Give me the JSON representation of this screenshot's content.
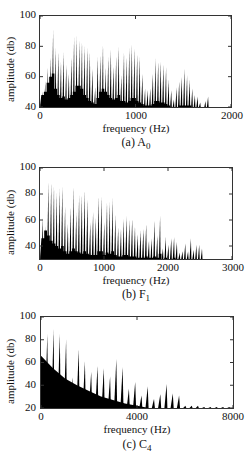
{
  "chart_data": [
    {
      "type": "bar",
      "title": "",
      "caption": "(a) A0",
      "caption_main": "(a) A",
      "caption_sub": "0",
      "xlabel": "frequency (Hz)",
      "ylabel": "amplitude (db)",
      "xlim": [
        0,
        2000
      ],
      "ylim": [
        40,
        100
      ],
      "xticks": [
        "0",
        "1000",
        "2000"
      ],
      "yticks": [
        "40",
        "60",
        "80",
        "100"
      ],
      "grid": false,
      "legend": null,
      "fundamental_hz": 27.5,
      "harmonic_peaks_db": [
        50,
        57,
        66,
        73,
        91,
        79,
        76,
        70,
        76,
        68,
        62,
        73,
        86,
        87,
        84,
        83,
        80,
        79,
        76,
        65,
        53,
        73,
        74,
        81,
        66,
        73,
        78,
        67,
        74,
        80,
        61,
        76,
        73,
        79,
        81,
        79,
        75,
        73,
        62,
        52,
        51,
        52,
        62,
        72,
        70,
        70,
        68,
        66,
        58,
        51,
        45,
        53,
        57,
        60,
        65,
        61,
        58,
        52,
        48,
        47,
        43,
        40,
        44,
        47
      ],
      "noise_floor_db": [
        48,
        50,
        56,
        60,
        62,
        52,
        48,
        46,
        47,
        45,
        46,
        48,
        50,
        54,
        54,
        52,
        48,
        46,
        44,
        43,
        42,
        46,
        50,
        52,
        50,
        48,
        46,
        45,
        46,
        48,
        44,
        44,
        43,
        44,
        46,
        46,
        44,
        43,
        42,
        41,
        41,
        41,
        42,
        44,
        44,
        43,
        43,
        42,
        41,
        40,
        40,
        40,
        41,
        41,
        41,
        41,
        41,
        40,
        40,
        40,
        40,
        40,
        40,
        40
      ]
    },
    {
      "type": "bar",
      "title": "",
      "caption": "(b) F1",
      "caption_main": "(b) F",
      "caption_sub": "1",
      "xlabel": "frequency (Hz)",
      "ylabel": "amplitude (db)",
      "xlim": [
        0,
        3000
      ],
      "ylim": [
        30,
        100
      ],
      "xticks": [
        "0",
        "1000",
        "2000",
        "3000"
      ],
      "yticks": [
        "40",
        "60",
        "80",
        "100"
      ],
      "grid": false,
      "legend": null,
      "fundamental_hz": 43.65,
      "harmonic_peaks_db": [
        62,
        55,
        89,
        89,
        86,
        81,
        84,
        86,
        70,
        57,
        70,
        86,
        66,
        79,
        79,
        83,
        76,
        58,
        66,
        62,
        78,
        78,
        58,
        74,
        74,
        77,
        64,
        54,
        53,
        61,
        63,
        60,
        61,
        55,
        49,
        52,
        53,
        57,
        44,
        46,
        60,
        48,
        63,
        38,
        47,
        41,
        46,
        47,
        43,
        35,
        36,
        42,
        36,
        46,
        37,
        41,
        41,
        38
      ],
      "noise_floor_db": [
        46,
        52,
        48,
        44,
        42,
        40,
        38,
        40,
        36,
        34,
        36,
        38,
        36,
        35,
        34,
        36,
        34,
        33,
        33,
        33,
        36,
        36,
        33,
        35,
        34,
        36,
        33,
        32,
        32,
        33,
        33,
        32,
        32,
        32,
        31,
        31,
        31,
        32,
        31,
        31,
        32,
        31,
        34,
        30,
        31,
        30,
        30,
        31,
        30,
        30,
        30,
        30,
        30,
        30,
        30,
        30,
        30,
        30
      ]
    },
    {
      "type": "bar",
      "title": "",
      "caption": "(c) C4",
      "caption_main": "(c) C",
      "caption_sub": "4",
      "xlabel": "frequency (Hz)",
      "ylabel": "amplitude (db)",
      "xlim": [
        0,
        8000
      ],
      "ylim": [
        20,
        100
      ],
      "xticks": [
        "0",
        "4000",
        "8000"
      ],
      "yticks": [
        "20",
        "40",
        "60",
        "80",
        "100"
      ],
      "grid": false,
      "legend": null,
      "fundamental_hz": 261.6,
      "harmonic_peaks_db": [
        85,
        89,
        85,
        80,
        47,
        72,
        61,
        52,
        57,
        55,
        48,
        63,
        56,
        37,
        43,
        31,
        39,
        28,
        32,
        41,
        33,
        31,
        22,
        22,
        22,
        21,
        21,
        21,
        21,
        21
      ],
      "noise_floor_description": "Dense broadband component starting near 66 dB at 0 Hz and decaying to ~20 dB by ~4200 Hz",
      "noise_floor_db_at": {
        "0": 66,
        "500": 55,
        "1000": 46,
        "1500": 40,
        "2000": 35,
        "2500": 30,
        "3000": 27,
        "3500": 24,
        "4000": 22,
        "4500": 20
      }
    }
  ]
}
